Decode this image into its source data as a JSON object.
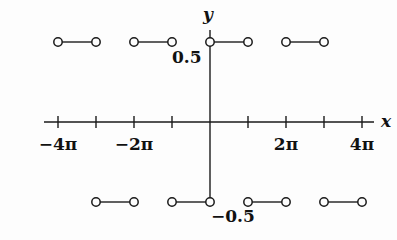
{
  "figure": {
    "background": "#fdfdfd",
    "width": 397,
    "height": 240,
    "stroke_color": "#1a1a1a"
  },
  "axes": {
    "x_label": "x",
    "y_label": "y",
    "x_label_pos": {
      "x": 381,
      "y": 113
    },
    "y_label_pos": {
      "x": 203,
      "y": 6
    },
    "x_axis_y": 122,
    "y_axis_x": 210,
    "x_axis_from": 44,
    "x_axis_to": 374,
    "y_axis_top": 30,
    "y_axis_bottom": 203,
    "tick_half_length": 6,
    "tick_positions_px": [
      58,
      96,
      134,
      172,
      248,
      286,
      324,
      362
    ],
    "tick_labels": [
      {
        "text": "−4π",
        "x": 58,
        "y": 136
      },
      {
        "text": "−2π",
        "x": 134,
        "y": 136
      },
      {
        "text": "2π",
        "x": 286,
        "y": 136
      },
      {
        "text": "4π",
        "x": 362,
        "y": 136
      }
    ],
    "value_labels": [
      {
        "text": "0.5",
        "x": 172,
        "y": 49
      },
      {
        "text": "−0.5",
        "x": 211,
        "y": 208
      }
    ]
  },
  "chart_data": {
    "type": "line",
    "title": "",
    "xlabel": "x",
    "ylabel": "y",
    "grid": false,
    "legend": null,
    "xlim_pi_units": [
      -5,
      5
    ],
    "ylim": [
      -0.5,
      0.5
    ],
    "x_tick_values_pi": [
      -4,
      -3,
      -2,
      -1,
      1,
      2,
      3,
      4
    ],
    "x_tick_labels": [
      "−4π",
      "",
      "−2π",
      "",
      "2π",
      "",
      "4π",
      ""
    ],
    "y_tick_values": [
      0.5,
      -0.5
    ],
    "y_tick_labels": [
      "0.5",
      "-0.5"
    ],
    "marker": "open-circle",
    "segments": [
      {
        "y": 0.5,
        "x1_px": 58,
        "x2_px": 96,
        "y_px": 42,
        "x1_pi": -5,
        "x2_pi": -4
      },
      {
        "y": 0.5,
        "x1_px": 134,
        "x2_px": 172,
        "y_px": 42,
        "x1_pi": -3,
        "x2_pi": -2
      },
      {
        "y": 0.5,
        "x1_px": 210,
        "x2_px": 248,
        "y_px": 42,
        "x1_pi": -1,
        "x2_pi": 0
      },
      {
        "y": 0.5,
        "x1_px": 286,
        "x2_px": 324,
        "y_px": 42,
        "x1_pi": 1,
        "x2_pi": 2
      },
      {
        "y": -0.5,
        "x1_px": 96,
        "x2_px": 134,
        "y_px": 202,
        "x1_pi": -4,
        "x2_pi": -3
      },
      {
        "y": -0.5,
        "x1_px": 172,
        "x2_px": 210,
        "y_px": 202,
        "x1_pi": -2,
        "x2_pi": -1
      },
      {
        "y": -0.5,
        "x1_px": 248,
        "x2_px": 286,
        "y_px": 202,
        "x1_pi": 0,
        "x2_pi": 1
      },
      {
        "y": -0.5,
        "x1_px": 324,
        "x2_px": 362,
        "y_px": 202,
        "x1_pi": 2,
        "x2_pi": 3
      }
    ]
  }
}
